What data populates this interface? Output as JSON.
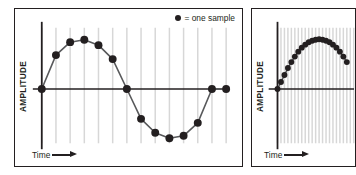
{
  "figure": {
    "background": "#ffffff",
    "ink_color": "#231f20",
    "grid_color": "#d7d7d7",
    "sample_color": "#231f20"
  },
  "legend": {
    "marker_icon": "filled-circle-icon",
    "text": "= one sample"
  },
  "panels": [
    {
      "id": "left",
      "y_axis_label": "AMPLITUDE",
      "x_axis_label": "Time",
      "x_axis_arrow_icon": "right-arrow-icon",
      "has_legend": true
    },
    {
      "id": "right",
      "y_axis_label": "AMPLITUDE",
      "x_axis_label": "Time",
      "x_axis_arrow_icon": "right-arrow-icon",
      "has_legend": false
    }
  ],
  "chart_data": [
    {
      "id": "left-chart",
      "type": "scatter",
      "title": "",
      "xlabel": "Time",
      "ylabel": "AMPLITUDE",
      "subtitle": "Sine wave sampled at a low sampling rate (about 13 samples per cycle)",
      "grid": true,
      "grid_orientation": "vertical",
      "grid_count": 13,
      "legend": "= one sample",
      "legend_position": "top-right",
      "xlim": [
        0,
        13
      ],
      "ylim": [
        -1.15,
        1.15
      ],
      "samples_per_cycle": 13,
      "x": [
        0,
        1,
        2,
        3,
        4,
        5,
        6,
        7,
        8,
        9,
        10,
        11,
        12,
        13
      ],
      "y": [
        0.0,
        0.68,
        0.94,
        0.99,
        0.88,
        0.6,
        0.0,
        -0.6,
        -0.88,
        -0.99,
        -0.94,
        -0.68,
        0.0,
        0.0
      ],
      "series": [
        {
          "name": "sampled sine wave",
          "marker": "filled-circle",
          "line": "solid",
          "values": [
            0.0,
            0.68,
            0.94,
            0.99,
            0.88,
            0.6,
            0.0,
            -0.6,
            -0.88,
            -0.99,
            -0.94,
            -0.68,
            0.0
          ]
        }
      ]
    },
    {
      "id": "right-chart",
      "type": "scatter",
      "title": "",
      "xlabel": "Time",
      "ylabel": "AMPLITUDE",
      "subtitle": "Same sine wave sampled at a much higher sampling rate (image cropped at right edge)",
      "grid": true,
      "grid_orientation": "vertical",
      "grid_count": 30,
      "legend": "",
      "legend_position": "none",
      "xlim": [
        0,
        30
      ],
      "ylim": [
        -1.15,
        1.15
      ],
      "samples_per_cycle": 44,
      "x": [
        0,
        1,
        2,
        3,
        4,
        5,
        6,
        7,
        8,
        9,
        10,
        11,
        12,
        13,
        14,
        15,
        16,
        17,
        18,
        19,
        20
      ],
      "y": [
        0.0,
        0.14,
        0.28,
        0.42,
        0.54,
        0.65,
        0.75,
        0.83,
        0.89,
        0.94,
        0.97,
        0.99,
        1.0,
        0.99,
        0.97,
        0.94,
        0.89,
        0.83,
        0.75,
        0.65,
        0.54
      ],
      "series": [
        {
          "name": "densely sampled sine wave",
          "marker": "filled-circle",
          "line": "solid",
          "values": [
            0.0,
            0.14,
            0.28,
            0.42,
            0.54,
            0.65,
            0.75,
            0.83,
            0.89,
            0.94,
            0.97,
            0.99,
            1.0,
            0.99,
            0.97,
            0.94,
            0.89,
            0.83,
            0.75,
            0.65,
            0.54
          ]
        }
      ]
    }
  ]
}
